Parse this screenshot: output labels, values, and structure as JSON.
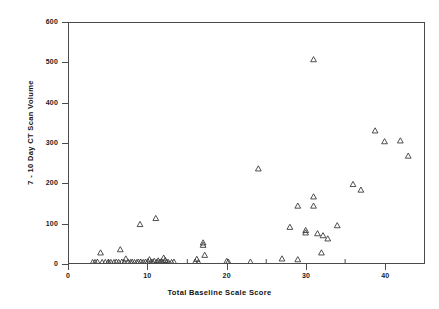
{
  "chart_data": {
    "type": "scatter",
    "title": "",
    "xlabel": "Total Baseline Scale Score",
    "ylabel": "7 - 10 Day CT Scan Volume",
    "xlim": [
      0,
      45
    ],
    "ylim": [
      0,
      600
    ],
    "xticks": [
      0,
      10,
      20,
      30,
      40
    ],
    "yticks": [
      0,
      100,
      200,
      300,
      400,
      500,
      600
    ],
    "xtick_labels": [
      "0",
      "10",
      "20",
      "30",
      "40"
    ],
    "ytick_labels": [
      "0",
      "100",
      "200",
      "300",
      "400",
      "500",
      "600"
    ],
    "grid": false,
    "legend": null,
    "marker": "open-triangle",
    "marker_color": "#3a3a3a",
    "series": [
      {
        "name": "patients",
        "points": [
          [
            3.0,
            1
          ],
          [
            3.3,
            1
          ],
          [
            3.6,
            2
          ],
          [
            4.0,
            25
          ],
          [
            4.2,
            1
          ],
          [
            4.6,
            1
          ],
          [
            5.0,
            2
          ],
          [
            5.3,
            1
          ],
          [
            5.7,
            1
          ],
          [
            6.0,
            2
          ],
          [
            6.3,
            1
          ],
          [
            6.5,
            33
          ],
          [
            6.7,
            2
          ],
          [
            7.0,
            1
          ],
          [
            7.2,
            10
          ],
          [
            7.5,
            2
          ],
          [
            7.8,
            1
          ],
          [
            8.0,
            2
          ],
          [
            8.3,
            1
          ],
          [
            8.6,
            1
          ],
          [
            8.8,
            2
          ],
          [
            9.0,
            96
          ],
          [
            9.1,
            2
          ],
          [
            9.4,
            1
          ],
          [
            9.7,
            2
          ],
          [
            10.0,
            3
          ],
          [
            10.2,
            8
          ],
          [
            10.4,
            2
          ],
          [
            10.6,
            1
          ],
          [
            10.8,
            4
          ],
          [
            11.0,
            111
          ],
          [
            11.1,
            2
          ],
          [
            11.3,
            5
          ],
          [
            11.5,
            2
          ],
          [
            11.7,
            3
          ],
          [
            11.9,
            1
          ],
          [
            12.0,
            12
          ],
          [
            12.2,
            6
          ],
          [
            12.4,
            2
          ],
          [
            12.6,
            1
          ],
          [
            13.0,
            1
          ],
          [
            13.3,
            2
          ],
          [
            16.0,
            2
          ],
          [
            16.2,
            9
          ],
          [
            16.4,
            1
          ],
          [
            17.0,
            50
          ],
          [
            17.0,
            44
          ],
          [
            17.2,
            19
          ],
          [
            20.0,
            4
          ],
          [
            20.2,
            2
          ],
          [
            23.0,
            2
          ],
          [
            24.0,
            235
          ],
          [
            27.0,
            10
          ],
          [
            28.0,
            89
          ],
          [
            29.0,
            8
          ],
          [
            29.0,
            142
          ],
          [
            30.0,
            81
          ],
          [
            30.0,
            75
          ],
          [
            31.0,
            508
          ],
          [
            31.0,
            165
          ],
          [
            31.0,
            142
          ],
          [
            31.5,
            73
          ],
          [
            32.0,
            25
          ],
          [
            32.2,
            68
          ],
          [
            32.8,
            60
          ],
          [
            34.0,
            93
          ],
          [
            36.0,
            196
          ],
          [
            37.0,
            182
          ],
          [
            38.8,
            330
          ],
          [
            40.0,
            303
          ],
          [
            42.0,
            305
          ],
          [
            43.0,
            267
          ]
        ]
      }
    ]
  },
  "axes": {
    "x_label": "Total Baseline Scale Score",
    "y_label": "7 - 10 Day CT Scan Volume"
  }
}
